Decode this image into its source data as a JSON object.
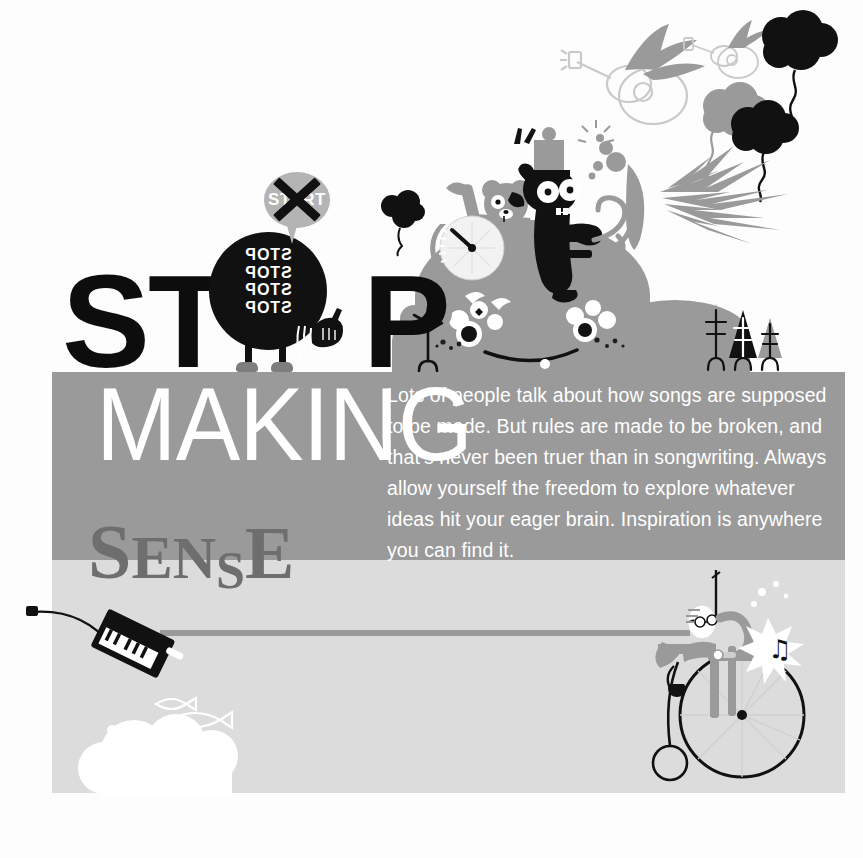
{
  "poster": {
    "title_line1": "STOP",
    "title_line1_pre": "ST",
    "title_line1_post": "P",
    "title_line2": "MAKING",
    "title_line3_letters": [
      "S",
      "E",
      "N",
      "S",
      "E"
    ],
    "title_line3": "SENSE",
    "body_text": "Lots of people talk about how songs are supposed to be made. But rules are made to be broken, and that’s never been truer than in songwriting. Always allow yourself the freedom to explore whatever ideas hit your eager brain. Inspiration is anywhere you can find it.",
    "sign_label": "START",
    "character_chant": "STOP\nSTOP\nSTOP\nSTOP",
    "character_chant_lines": [
      "STOP",
      "STOP",
      "STOP",
      "STOP"
    ],
    "music_note_glyph": "♫",
    "colors": {
      "background": "#fdfdfd",
      "panel_mid_gray": "#9a9a9a",
      "panel_light_gray": "#dcdcdc",
      "headline_black": "#0d0d0d",
      "headline_white": "#ffffff",
      "sense_gray": "#6e6e6e",
      "bubble_gray": "#b4b4b4",
      "ink_black": "#111111",
      "accent_gray": "#7d7d7d"
    }
  },
  "illustration": {
    "hill_label": "hill-creature",
    "trumpeter_label": "trumpet-player",
    "bear_label": "bear-drummer",
    "bicycle_label": "penny-farthing",
    "keytar_label": "keytar",
    "fish_label": "fish-doodles",
    "trees_label": "pine-trees",
    "flying_guitars_label": "winged-guitars",
    "balloons_label": "thought-balloons"
  }
}
